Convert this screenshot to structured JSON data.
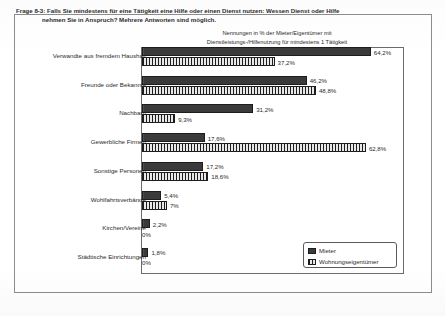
{
  "heading": {
    "line1": "Frage 8-3: Falls Sie mindestens für eine Tätigkeit eine Hilfe oder einen Dienst nutzen: Wessen Dienst oder Hilfe",
    "line2": "nehmen Sie in Anspruch? Mehrere Antworten sind möglich."
  },
  "subtitle": {
    "line1": "Nennungen in % der Mieter/Eigentümer mit",
    "line2": "Dienstleistungs-/Hilfenutzung für mindestens 1 Tätigkeit"
  },
  "legend": {
    "items": [
      {
        "label": "Mieter",
        "color": "#3a3a3a",
        "pattern": "solid"
      },
      {
        "label": "Wohnungseigentümer",
        "color": "#e8e8e8",
        "pattern": "vertical-stripes"
      }
    ]
  },
  "chart_data": {
    "type": "bar",
    "orientation": "horizontal",
    "title": "Nennungen in % der Mieter/Eigentümer mit Dienstleistungs-/Hilfenutzung für mindestens 1 Tätigkeit",
    "xlabel": "",
    "ylabel": "",
    "xlim": [
      0,
      70
    ],
    "grid": false,
    "legend_position": "bottom-right",
    "categories": [
      "Verwandte aus fremdem Haushalt",
      "Freunde oder Bekannte",
      "Nachbarn",
      "Gewerbliche Firmen",
      "Sonstige Personen",
      "Wohlfahrtsverbände",
      "Kirchen/Vereine",
      "Städtische Einrichtungen"
    ],
    "series": [
      {
        "name": "Mieter",
        "values": [
          64.2,
          46.2,
          31.2,
          17.6,
          17.2,
          5.4,
          2.2,
          1.8
        ],
        "labels": [
          "64,2%",
          "46,2%",
          "31,2%",
          "17,6%",
          "17,2%",
          "5,4%",
          "2,2%",
          "1,8%"
        ]
      },
      {
        "name": "Wohnungseigentümer",
        "values": [
          37.2,
          48.8,
          9.3,
          62.8,
          18.6,
          7.0,
          0,
          0
        ],
        "labels": [
          "37,2%",
          "48,8%",
          "9,3%",
          "62,8%",
          "18,6%",
          "7%",
          "0%",
          "0%"
        ]
      }
    ]
  }
}
